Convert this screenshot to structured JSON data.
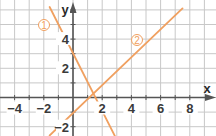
{
  "chart_data": {
    "type": "line",
    "title": "",
    "xlabel": "x",
    "ylabel": "y",
    "xlim": [
      -5,
      9.7
    ],
    "ylim": [
      -2.7,
      6.6
    ],
    "grid": true,
    "x_ticks": [
      -4,
      -2,
      2,
      4,
      6,
      8
    ],
    "y_ticks": [
      -2,
      2,
      4
    ],
    "x_tick_labels": [
      "−4",
      "−2",
      "2",
      "4",
      "6",
      "8"
    ],
    "y_tick_labels": [
      "−2",
      "2",
      "4"
    ],
    "series": [
      {
        "name": "1",
        "label": "①",
        "equation": "y = -2x + 3",
        "x": [
          -1.6,
          2.9
        ],
        "y": [
          6.2,
          -2.7
        ],
        "color": "#f0a060"
      },
      {
        "name": "2",
        "label": "②",
        "equation": "y = x - 1",
        "x": [
          -1.6,
          7.5
        ],
        "y": [
          -2.6,
          6.1
        ],
        "color": "#f0a060"
      }
    ]
  },
  "colors": {
    "grid": "#c8c8c8",
    "axis": "#555555",
    "line": "#f0a060",
    "text": "#3a3a3a"
  }
}
